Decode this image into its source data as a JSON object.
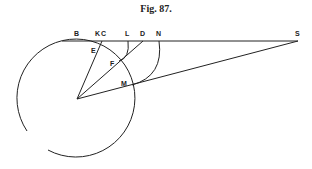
{
  "caption": "Fig. 87.",
  "labels": {
    "B": "B",
    "K": "K",
    "C": "C",
    "L": "L",
    "D": "D",
    "N": "N",
    "S": "S",
    "E": "E",
    "F": "F",
    "M": "M"
  },
  "colors": {
    "ink": "#222222",
    "background": "#ffffff"
  }
}
